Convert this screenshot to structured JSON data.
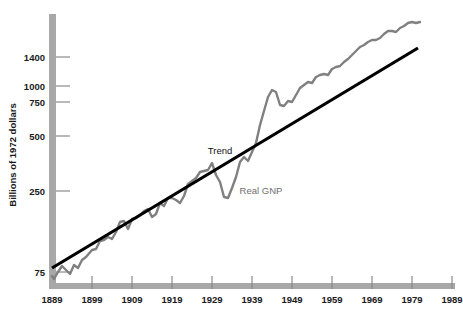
{
  "chart_data": {
    "type": "line",
    "title": "",
    "xlabel": "",
    "ylabel": "Billions of 1972 dollars",
    "y_scale": "log",
    "ylim": [
      60,
      1900
    ],
    "xlim": [
      1889,
      1989
    ],
    "grid": false,
    "legend_position": "inline-annotations",
    "y_ticks": [
      {
        "value": 1400,
        "label": "1400",
        "y_px": 57
      },
      {
        "value": 1000,
        "label": "1000",
        "y_px": 86
      },
      {
        "value": 750,
        "label": "750",
        "y_px": 102
      },
      {
        "value": 500,
        "label": "500",
        "y_px": 136
      },
      {
        "value": 250,
        "label": "250",
        "y_px": 191
      },
      {
        "value": 75,
        "label": "75",
        "y_px": 272
      }
    ],
    "x_ticks": [
      {
        "value": 1889,
        "label": "1889",
        "x_px": 52
      },
      {
        "value": 1899,
        "label": "1899",
        "x_px": 92
      },
      {
        "value": 1909,
        "label": "1909",
        "x_px": 132
      },
      {
        "value": 1919,
        "label": "1919",
        "x_px": 172
      },
      {
        "value": 1929,
        "label": "1929",
        "x_px": 212
      },
      {
        "value": 1939,
        "label": "1939",
        "x_px": 252
      },
      {
        "value": 1949,
        "label": "1949",
        "x_px": 292
      },
      {
        "value": 1959,
        "label": "1959",
        "x_px": 332
      },
      {
        "value": 1969,
        "label": "1969",
        "x_px": 372
      },
      {
        "value": 1979,
        "label": "1979",
        "x_px": 412
      },
      {
        "value": 1989,
        "label": "1989",
        "x_px": 452
      }
    ],
    "annotations": [
      {
        "text": "Trend",
        "x_px": 220,
        "y_px": 154,
        "color": "#111111"
      },
      {
        "text": "Real GNP",
        "x_px": 261,
        "y_px": 194,
        "color": "#6e6e6e"
      }
    ],
    "series": [
      {
        "name": "Trend",
        "color": "#000000",
        "width": 3.2,
        "type": "straight-line",
        "endpoints": [
          {
            "x": 1889,
            "y": 78
          },
          {
            "x": 1981,
            "y": 1420
          }
        ],
        "points_px": [
          [
            52,
            268
          ],
          [
            418,
            48
          ]
        ]
      },
      {
        "name": "Real GNP",
        "color": "#808080",
        "width": 2.4,
        "type": "series",
        "x": [
          1889,
          1890,
          1891,
          1892,
          1893,
          1894,
          1895,
          1896,
          1897,
          1898,
          1899,
          1900,
          1901,
          1902,
          1903,
          1904,
          1905,
          1906,
          1907,
          1908,
          1909,
          1910,
          1911,
          1912,
          1913,
          1914,
          1915,
          1916,
          1917,
          1918,
          1919,
          1920,
          1921,
          1922,
          1923,
          1924,
          1925,
          1926,
          1927,
          1928,
          1929,
          1930,
          1931,
          1932,
          1933,
          1934,
          1935,
          1936,
          1937,
          1938,
          1939,
          1940,
          1941,
          1942,
          1943,
          1944,
          1945,
          1946,
          1947,
          1948,
          1949,
          1950,
          1951,
          1952,
          1953,
          1954,
          1955,
          1956,
          1957,
          1958,
          1959,
          1960,
          1961,
          1962,
          1963,
          1964,
          1965,
          1966,
          1967,
          1968,
          1969,
          1970,
          1971,
          1972,
          1973,
          1974,
          1975,
          1976,
          1977,
          1978,
          1979,
          1980,
          1981
        ],
        "values": [
          68,
          66,
          72,
          78,
          74,
          71,
          79,
          77,
          84,
          87,
          94,
          95,
          105,
          106,
          110,
          108,
          117,
          131,
          133,
          121,
          135,
          137,
          142,
          149,
          152,
          140,
          144,
          164,
          160,
          174,
          174,
          172,
          168,
          178,
          200,
          206,
          211,
          225,
          227,
          230,
          246,
          224,
          209,
          180,
          178,
          194,
          212,
          242,
          253,
          243,
          262,
          286,
          335,
          382,
          443,
          480,
          473,
          419,
          415,
          432,
          429,
          467,
          503,
          521,
          544,
          536,
          577,
          589,
          600,
          595,
          636,
          650,
          664,
          704,
          734,
          777,
          827,
          879,
          903,
          946,
          976,
          974,
          1006,
          1060,
          1118,
          1108,
          1093,
          1153,
          1206,
          1271,
          1310,
          1298,
          1330
        ],
        "points_px": [
          [
            52,
            276
          ],
          [
            54,
            279
          ],
          [
            58,
            272
          ],
          [
            62,
            266
          ],
          [
            66,
            270
          ],
          [
            70,
            274
          ],
          [
            74,
            265
          ],
          [
            78,
            268
          ],
          [
            82,
            260
          ],
          [
            86,
            257
          ],
          [
            92,
            250
          ],
          [
            96,
            249
          ],
          [
            100,
            241
          ],
          [
            104,
            240
          ],
          [
            108,
            237
          ],
          [
            112,
            239
          ],
          [
            116,
            232
          ],
          [
            120,
            222
          ],
          [
            124,
            221
          ],
          [
            128,
            229
          ],
          [
            132,
            219
          ],
          [
            136,
            218
          ],
          [
            140,
            215
          ],
          [
            144,
            211
          ],
          [
            148,
            209
          ],
          [
            152,
            217
          ],
          [
            156,
            214
          ],
          [
            160,
            203
          ],
          [
            164,
            206
          ],
          [
            168,
            198
          ],
          [
            172,
            198
          ],
          [
            176,
            200
          ],
          [
            180,
            203
          ],
          [
            184,
            196
          ],
          [
            188,
            184
          ],
          [
            192,
            181
          ],
          [
            196,
            178
          ],
          [
            200,
            172
          ],
          [
            204,
            171
          ],
          [
            208,
            170
          ],
          [
            212,
            163
          ],
          [
            216,
            175
          ],
          [
            220,
            182
          ],
          [
            224,
            197
          ],
          [
            228,
            198
          ],
          [
            232,
            188
          ],
          [
            236,
            177
          ],
          [
            240,
            162
          ],
          [
            244,
            157
          ],
          [
            248,
            161
          ],
          [
            252,
            152
          ],
          [
            256,
            143
          ],
          [
            260,
            125
          ],
          [
            264,
            111
          ],
          [
            268,
            97
          ],
          [
            272,
            90
          ],
          [
            276,
            92
          ],
          [
            280,
            105
          ],
          [
            284,
            106
          ],
          [
            288,
            101
          ],
          [
            292,
            102
          ],
          [
            296,
            95
          ],
          [
            300,
            88
          ],
          [
            304,
            85
          ],
          [
            308,
            82
          ],
          [
            312,
            83
          ],
          [
            316,
            77
          ],
          [
            320,
            75
          ],
          [
            324,
            74
          ],
          [
            328,
            75
          ],
          [
            332,
            69
          ],
          [
            336,
            67
          ],
          [
            340,
            66
          ],
          [
            344,
            62
          ],
          [
            348,
            59
          ],
          [
            352,
            55
          ],
          [
            356,
            51
          ],
          [
            360,
            47
          ],
          [
            364,
            45
          ],
          [
            368,
            42
          ],
          [
            372,
            40
          ],
          [
            376,
            40
          ],
          [
            380,
            38
          ],
          [
            384,
            34
          ],
          [
            388,
            31
          ],
          [
            392,
            31
          ],
          [
            396,
            32
          ],
          [
            400,
            28
          ],
          [
            404,
            26
          ],
          [
            408,
            23
          ],
          [
            412,
            22
          ],
          [
            416,
            23
          ],
          [
            420,
            22
          ]
        ]
      }
    ]
  },
  "axes": {
    "y_axis_bar_color": "#a8a8a8",
    "x_axis_bar_color": "#a8a8a8",
    "tick_color": "#8a8a8a"
  }
}
